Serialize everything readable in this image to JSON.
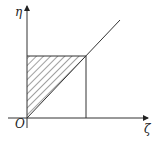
{
  "diagram": {
    "type": "region-of-integration",
    "axes": {
      "x_label": "ζ",
      "y_label": "η",
      "origin_label": "O"
    },
    "elements": [
      {
        "kind": "line",
        "name": "diagonal",
        "description": "line η = ζ from origin, extends beyond corner"
      },
      {
        "kind": "line",
        "name": "horizontal",
        "description": "horizontal segment from η-axis to diagonal at top of region"
      },
      {
        "kind": "line",
        "name": "vertical",
        "description": "vertical segment from corner down to ζ-axis"
      },
      {
        "kind": "region",
        "name": "shaded-triangle",
        "description": "hatched triangle bounded by η-axis, horizontal line and diagonal"
      }
    ],
    "colors": {
      "line": "#333333",
      "hatch": "#444444",
      "background": "#ffffff"
    }
  }
}
